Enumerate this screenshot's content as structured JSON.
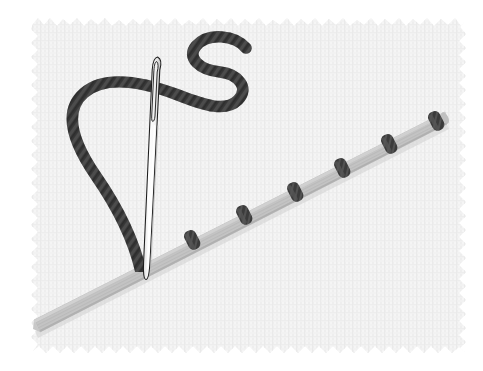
{
  "image": {
    "title": "Needle and thread stitching a ribbon onto fabric",
    "width": 483,
    "height": 371,
    "background_color": "#ffffff"
  },
  "fabric": {
    "name": "woven fabric swatch",
    "base_color": "#f3f3f3",
    "weave_line_color": "#e6e6e6",
    "weave_spacing_px": 4,
    "edge_style": "frayed pinked zigzag",
    "bounds": {
      "left": 31,
      "top": 17,
      "right": 466,
      "bottom": 353
    }
  },
  "ribbon": {
    "name": "diagonal grosgrain ribbon",
    "color": "#c2c2c2",
    "shadow_color": "#b4b4b4",
    "width_px": 13,
    "start": {
      "x": 35,
      "y": 327
    },
    "end": {
      "x": 446,
      "y": 118
    },
    "angle_deg": -27
  },
  "stitches": {
    "name": "running stitches across ribbon",
    "color": "#3b3b3b",
    "count": 6,
    "points": [
      {
        "x": 192,
        "y": 240
      },
      {
        "x": 244,
        "y": 215
      },
      {
        "x": 295,
        "y": 192
      },
      {
        "x": 342,
        "y": 168
      },
      {
        "x": 389,
        "y": 144
      },
      {
        "x": 436,
        "y": 121
      }
    ]
  },
  "thread": {
    "name": "twisted embroidery thread",
    "color": "#3a3a3a",
    "highlight_color": "#575757",
    "thickness_px": 11,
    "shape": "S-curve loop entering the ribbon",
    "tail_end": {
      "x": 246,
      "y": 48
    },
    "entry_point": {
      "x": 141,
      "y": 272
    }
  },
  "needle": {
    "name": "sewing needle",
    "body_color": "#fbfbfb",
    "outline_color": "#1c1c1c",
    "eye_shape": "elongated oval slot",
    "top": {
      "x": 158,
      "y": 57
    },
    "tip": {
      "x": 146,
      "y": 279
    },
    "length_px": 222
  }
}
